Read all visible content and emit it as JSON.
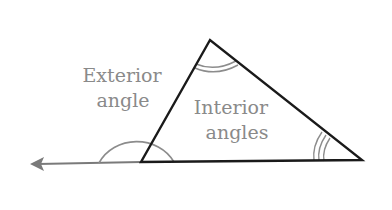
{
  "diagram": {
    "type": "triangle-angles",
    "labels": {
      "exterior_line1": "Exterior",
      "exterior_line2": "angle",
      "interior_line1": "Interior",
      "interior_line2": "angles"
    },
    "colors": {
      "triangle_stroke": "#1a1a1a",
      "annotation_stroke": "#8c8c8c",
      "arrow": "#7a7a7a",
      "text": "#8a8a8a",
      "background": "#ffffff"
    },
    "vertices": {
      "top": [
        210,
        40
      ],
      "left": [
        141,
        162
      ],
      "right": [
        362,
        160
      ]
    },
    "angle_marks": {
      "top": "double-arc",
      "right": "triple-arc",
      "exterior": "semicircle"
    }
  }
}
